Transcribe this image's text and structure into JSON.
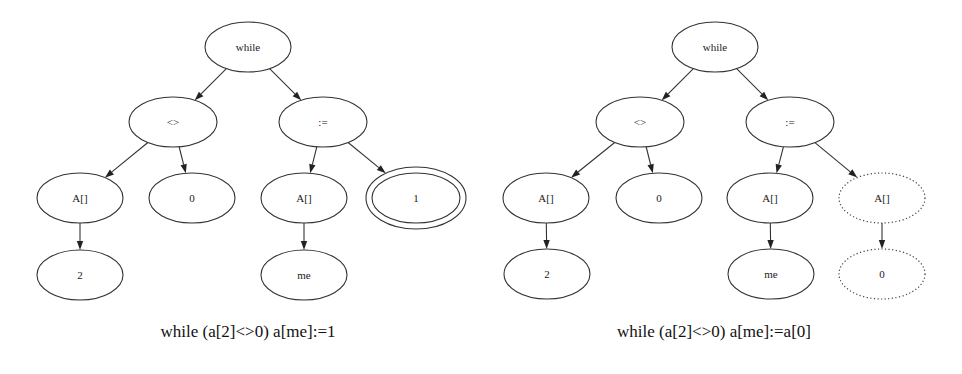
{
  "diagrams": [
    {
      "id": "left",
      "caption": "while (a[2]<>0) a[me]:=1",
      "caption_pos": {
        "x": 248,
        "y": 337
      },
      "nodes": [
        {
          "id": "while",
          "label": "while",
          "cx": 248,
          "cy": 47,
          "rx": 43,
          "ry": 25,
          "style": "solid"
        },
        {
          "id": "neq",
          "label": "<>",
          "cx": 173,
          "cy": 122,
          "rx": 44,
          "ry": 25,
          "style": "solid"
        },
        {
          "id": "assign",
          "label": ":=",
          "cx": 323,
          "cy": 122,
          "rx": 44,
          "ry": 25,
          "style": "solid"
        },
        {
          "id": "arr1",
          "label": "A[]",
          "cx": 80,
          "cy": 198,
          "rx": 43,
          "ry": 25,
          "style": "solid"
        },
        {
          "id": "zero",
          "label": "0",
          "cx": 192,
          "cy": 198,
          "rx": 43,
          "ry": 25,
          "style": "solid"
        },
        {
          "id": "arr2",
          "label": "A[]",
          "cx": 304,
          "cy": 198,
          "rx": 43,
          "ry": 25,
          "style": "solid"
        },
        {
          "id": "one",
          "label": "1",
          "cx": 416,
          "cy": 198,
          "rx": 44,
          "ry": 25,
          "style": "double"
        },
        {
          "id": "two",
          "label": "2",
          "cx": 80,
          "cy": 275,
          "rx": 43,
          "ry": 25,
          "style": "solid"
        },
        {
          "id": "me",
          "label": "me",
          "cx": 304,
          "cy": 275,
          "rx": 43,
          "ry": 25,
          "style": "solid"
        }
      ],
      "edges": [
        {
          "from": "while",
          "to": "neq"
        },
        {
          "from": "while",
          "to": "assign"
        },
        {
          "from": "neq",
          "to": "arr1"
        },
        {
          "from": "neq",
          "to": "zero"
        },
        {
          "from": "assign",
          "to": "arr2"
        },
        {
          "from": "assign",
          "to": "one"
        },
        {
          "from": "arr1",
          "to": "two"
        },
        {
          "from": "arr2",
          "to": "me"
        }
      ]
    },
    {
      "id": "right",
      "caption": "while (a[2]<>0) a[me]:=a[0]",
      "caption_pos": {
        "x": 714,
        "y": 337
      },
      "nodes": [
        {
          "id": "while",
          "label": "while",
          "cx": 715,
          "cy": 47,
          "rx": 43,
          "ry": 25,
          "style": "solid"
        },
        {
          "id": "neq",
          "label": "<>",
          "cx": 640,
          "cy": 122,
          "rx": 44,
          "ry": 25,
          "style": "solid"
        },
        {
          "id": "assign",
          "label": ":=",
          "cx": 790,
          "cy": 122,
          "rx": 44,
          "ry": 25,
          "style": "solid"
        },
        {
          "id": "arr1",
          "label": "A[]",
          "cx": 546,
          "cy": 198,
          "rx": 43,
          "ry": 25,
          "style": "solid"
        },
        {
          "id": "zero",
          "label": "0",
          "cx": 659,
          "cy": 198,
          "rx": 43,
          "ry": 25,
          "style": "solid"
        },
        {
          "id": "arr2",
          "label": "A[]",
          "cx": 770,
          "cy": 198,
          "rx": 43,
          "ry": 25,
          "style": "solid"
        },
        {
          "id": "arr3",
          "label": "A[]",
          "cx": 882,
          "cy": 198,
          "rx": 43,
          "ry": 25,
          "style": "dotted"
        },
        {
          "id": "two",
          "label": "2",
          "cx": 547,
          "cy": 274,
          "rx": 43,
          "ry": 25,
          "style": "solid"
        },
        {
          "id": "me",
          "label": "me",
          "cx": 771,
          "cy": 274,
          "rx": 43,
          "ry": 25,
          "style": "solid"
        },
        {
          "id": "zero2",
          "label": "0",
          "cx": 882,
          "cy": 274,
          "rx": 43,
          "ry": 25,
          "style": "dotted"
        }
      ],
      "edges": [
        {
          "from": "while",
          "to": "neq"
        },
        {
          "from": "while",
          "to": "assign"
        },
        {
          "from": "neq",
          "to": "arr1"
        },
        {
          "from": "neq",
          "to": "zero"
        },
        {
          "from": "assign",
          "to": "arr2"
        },
        {
          "from": "assign",
          "to": "arr3"
        },
        {
          "from": "arr1",
          "to": "two"
        },
        {
          "from": "arr2",
          "to": "me"
        },
        {
          "from": "arr3",
          "to": "zero2"
        }
      ]
    }
  ],
  "legend_semantics": {
    "double_ellipse": "replaced subtree (constant 1)",
    "dotted_ellipse": "substituted subtree a[0]"
  },
  "colors": {
    "background": "#ffffff",
    "stroke": "#333333",
    "text": "#222222"
  }
}
